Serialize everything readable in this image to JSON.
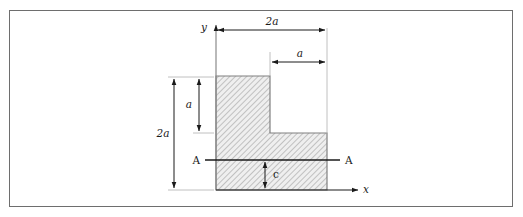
{
  "figure": {
    "background_color": "#ffffff",
    "frame_color": "#6e6e6e",
    "line_color": "#1a1a1a",
    "hatch_color": "#9a9a9a",
    "fill_color": "#e8e8e8",
    "axes": {
      "y_label": "y",
      "x_label": "x"
    },
    "dimensions": {
      "top_width": "2a",
      "top_inner_width": "a",
      "left_height": "2a",
      "left_inner_height": "a",
      "centroid_height": "c"
    },
    "section": {
      "left_label": "A",
      "right_label": "A"
    }
  }
}
